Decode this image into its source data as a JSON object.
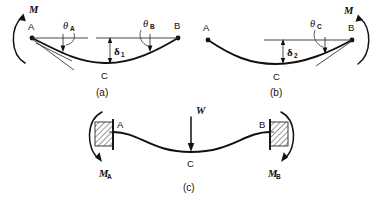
{
  "figure": {
    "background_color": "#ffffff",
    "ink_color": "#111111"
  },
  "panels": [
    {
      "id": "a",
      "caption": "(a)",
      "description": "Simply supported beam AB with an applied end moment M at A producing single-curvature sag",
      "nodes": [
        {
          "name": "A",
          "label": "A"
        },
        {
          "name": "B",
          "label": "B"
        },
        {
          "name": "C",
          "label": "C"
        }
      ],
      "angles": [
        {
          "name": "theta-a",
          "symbol": "θ",
          "subscript": "A"
        },
        {
          "name": "theta-b",
          "symbol": "θ",
          "subscript": "B"
        }
      ],
      "deflection": {
        "name": "delta-1",
        "symbol": "δ",
        "subscript": "1"
      },
      "moment": {
        "name": "moment-m-a",
        "label": "M",
        "sense": "counterclockwise",
        "at": "A"
      }
    },
    {
      "id": "b",
      "caption": "(b)",
      "description": "Simply supported beam AB with an applied end moment M at B producing single-curvature sag",
      "nodes": [
        {
          "name": "A",
          "label": "A"
        },
        {
          "name": "B",
          "label": "B"
        },
        {
          "name": "C",
          "label": "C"
        }
      ],
      "angles": [
        {
          "name": "theta-c",
          "symbol": "θ",
          "subscript": "C"
        }
      ],
      "deflection": {
        "name": "delta-2",
        "symbol": "δ",
        "subscript": "2"
      },
      "moment": {
        "name": "moment-m-b",
        "label": "M",
        "sense": "clockwise",
        "at": "B"
      }
    },
    {
      "id": "c",
      "caption": "(c)",
      "description": "Fixed-fixed beam AB with central point load W producing double curvature and fixed-end moments",
      "nodes": [
        {
          "name": "A",
          "label": "A"
        },
        {
          "name": "B",
          "label": "B"
        },
        {
          "name": "C",
          "label": "C"
        }
      ],
      "load": {
        "name": "load-w",
        "label": "W",
        "direction": "downward",
        "at": "C"
      },
      "moments": [
        {
          "name": "moment-ma",
          "label": "M",
          "subscript": "A",
          "sense": "clockwise",
          "at": "A"
        },
        {
          "name": "moment-mb",
          "label": "M",
          "subscript": "B",
          "sense": "clockwise",
          "at": "B"
        }
      ],
      "supports": [
        {
          "name": "fixed-support-left",
          "type": "fixed",
          "hatched": true
        },
        {
          "name": "fixed-support-right",
          "type": "fixed",
          "hatched": true
        }
      ]
    }
  ]
}
